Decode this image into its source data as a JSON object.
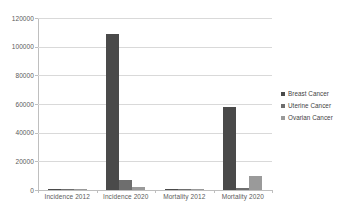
{
  "chart_data": {
    "type": "bar",
    "title": "",
    "xlabel": "",
    "ylabel": "",
    "categories": [
      "Incidence 2012",
      "Incidence 2020",
      "Mortality 2012",
      "Mortality 2020"
    ],
    "series": [
      {
        "name": "Breast Cancer",
        "color": "#4a4a4a",
        "values": [
          900,
          109000,
          300,
          58000
        ]
      },
      {
        "name": "Uterine Cancer",
        "color": "#6e6e6e",
        "values": [
          200,
          7000,
          100,
          1200
        ]
      },
      {
        "name": "Ovarian Cancer",
        "color": "#9a9a9a",
        "values": [
          150,
          2000,
          100,
          10000
        ]
      }
    ],
    "ylim": [
      0,
      120000
    ],
    "ytick_step": 20000,
    "yticks": [
      "0",
      "20000",
      "40000",
      "60000",
      "80000",
      "100000",
      "120000"
    ],
    "grid": true,
    "legend_position": "right"
  },
  "colors": {
    "gridline": "#d9d9d9",
    "axis": "#bfbfbf",
    "background": "#ffffff",
    "text": "#5a5a5a"
  }
}
